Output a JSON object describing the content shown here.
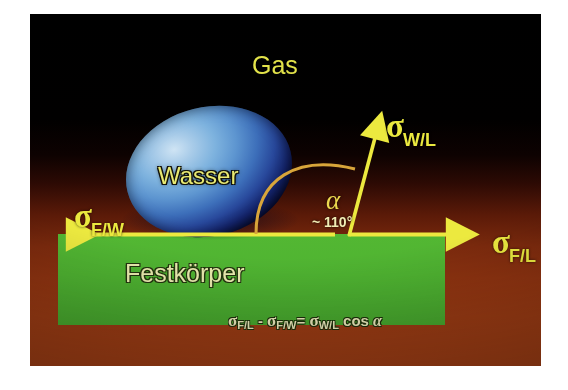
{
  "figure": {
    "labels": {
      "gas": "Gas",
      "water": "Wasser",
      "solid": "Festkörper"
    },
    "angle": {
      "symbol": "α",
      "value": "~ 110°"
    },
    "vectors": [
      {
        "name": "sigma-solid-water",
        "base": "σ",
        "subscript": "F/W",
        "direction": "left",
        "arrow_from": [
          300,
          220
        ],
        "arrow_to": [
          40,
          220
        ]
      },
      {
        "name": "sigma-solid-gas",
        "base": "σ",
        "subscript": "F/L",
        "direction": "right",
        "arrow_from": [
          318,
          220
        ],
        "arrow_to": [
          427,
          220
        ]
      },
      {
        "name": "sigma-water-gas",
        "base": "σ",
        "subscript": "W/L",
        "direction": "up-right",
        "arrow_from": [
          318,
          222
        ],
        "arrow_to": [
          349,
          112
        ]
      }
    ],
    "equation": {
      "lhs_sigma": "σ",
      "lhs_sub": "F/L",
      "minus": "-",
      "sub_sigma": "σ",
      "sub_sub": "F/W",
      "equals": "=",
      "rhs_sigma": "σ",
      "rhs_sub": "W/L",
      "cos": "cos",
      "alpha": "α",
      "full_text": "σF/L - σF/W = σW/L cos α"
    },
    "colors": {
      "accent_yellow": "#ebe93f",
      "solid_green": "#51b532",
      "water_blue": "#4a80c6",
      "background_top": "#000000",
      "background_bottom": "#a54015",
      "page_white": "#ffffff"
    }
  }
}
